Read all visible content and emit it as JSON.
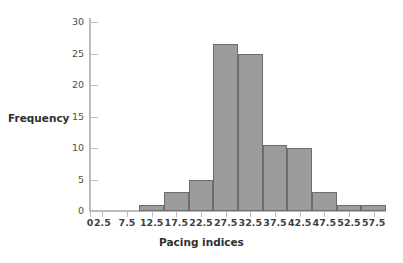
{
  "chart_data": {
    "type": "bar",
    "title": "",
    "subtitle": "",
    "xlabel": "Pacing indices",
    "ylabel": "Frequency",
    "grid": false,
    "legend": null,
    "xlim": [
      0,
      60
    ],
    "ylim": [
      0,
      31
    ],
    "ytick_values": [
      0,
      5,
      10,
      15,
      20,
      25,
      30
    ],
    "ytick_labels": [
      "0",
      "5",
      "10",
      "15",
      "20",
      "25",
      "30"
    ],
    "xtick_values": [
      0,
      2.5,
      7.5,
      12.5,
      17.5,
      22.5,
      27.5,
      32.5,
      37.5,
      42.5,
      47.5,
      52.5,
      57.5
    ],
    "xtick_labels": [
      "0",
      "2.5",
      "7.5",
      "12.5",
      "17.5",
      "22.5",
      "27.5",
      "32.5",
      "37.5",
      "42.5",
      "47.5",
      "52.5",
      "57.5"
    ],
    "bin_width": 5,
    "bins": [
      {
        "left": 10.0,
        "right": 15.0,
        "center": 12.5,
        "value": 1
      },
      {
        "left": 15.0,
        "right": 20.0,
        "center": 17.5,
        "value": 3
      },
      {
        "left": 20.0,
        "right": 25.0,
        "center": 22.5,
        "value": 5
      },
      {
        "left": 25.0,
        "right": 30.0,
        "center": 27.5,
        "value": 26.5
      },
      {
        "left": 30.0,
        "right": 35.0,
        "center": 32.5,
        "value": 25
      },
      {
        "left": 35.0,
        "right": 40.0,
        "center": 37.5,
        "value": 10.5
      },
      {
        "left": 40.0,
        "right": 45.0,
        "center": 42.5,
        "value": 10
      },
      {
        "left": 45.0,
        "right": 50.0,
        "center": 47.5,
        "value": 3
      },
      {
        "left": 50.0,
        "right": 55.0,
        "center": 52.5,
        "value": 1
      },
      {
        "left": 55.0,
        "right": 60.0,
        "center": 57.5,
        "value": 1
      }
    ],
    "categories": [
      "12.5",
      "17.5",
      "22.5",
      "27.5",
      "32.5",
      "37.5",
      "42.5",
      "47.5",
      "52.5",
      "57.5"
    ],
    "values": [
      1,
      3,
      5,
      26.5,
      25,
      10.5,
      10,
      3,
      1,
      1
    ],
    "colors": {
      "bar_fill": "#9c9c9c",
      "bar_edge": "#6d6d6d",
      "axis": "#bcbcbc",
      "text": "#2f2f2f",
      "background": "#ffffff"
    }
  }
}
